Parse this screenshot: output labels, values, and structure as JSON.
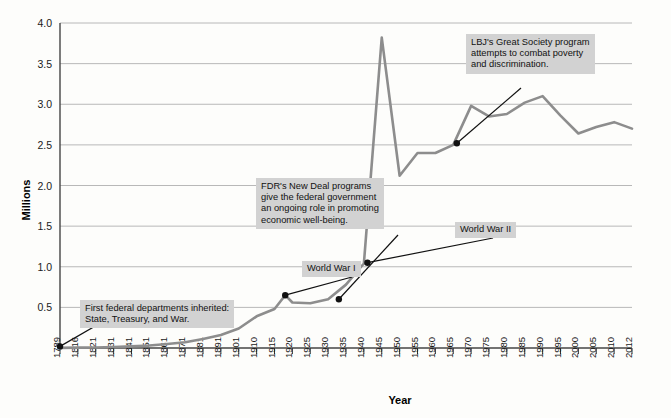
{
  "chart_data": {
    "type": "line",
    "title": "",
    "xlabel": "Year",
    "ylabel": "Millions",
    "ylim": [
      0,
      4.0
    ],
    "y_ticks": [
      "0.5",
      "1.0",
      "1.5",
      "2.0",
      "2.5",
      "3.0",
      "3.5",
      "4.0"
    ],
    "y_tick_values": [
      0.5,
      1.0,
      1.5,
      2.0,
      2.5,
      3.0,
      3.5,
      4.0
    ],
    "grid": true,
    "legend": "none",
    "x_tick_labels": [
      "1789",
      "1816",
      "1821",
      "1831",
      "1841",
      "1851",
      "1861",
      "1871",
      "1881",
      "1891",
      "1901",
      "1910",
      "1915",
      "1920",
      "1925",
      "1930",
      "1935",
      "1940",
      "1945",
      "1950",
      "1955",
      "1960",
      "1965",
      "1970",
      "1975",
      "1980",
      "1985",
      "1990",
      "1995",
      "2000",
      "2005",
      "2010",
      "2012"
    ],
    "series": [
      {
        "name": "Federal civilian employment",
        "x": [
          1789,
          1816,
          1821,
          1831,
          1841,
          1851,
          1861,
          1871,
          1881,
          1891,
          1901,
          1910,
          1915,
          1918,
          1920,
          1925,
          1930,
          1935,
          1940,
          1945,
          1950,
          1955,
          1960,
          1965,
          1970,
          1975,
          1980,
          1985,
          1990,
          1995,
          2000,
          2005,
          2010,
          2012
        ],
        "values": [
          0.001,
          0.005,
          0.007,
          0.012,
          0.02,
          0.03,
          0.05,
          0.07,
          0.11,
          0.16,
          0.24,
          0.39,
          0.48,
          0.65,
          0.56,
          0.55,
          0.6,
          0.78,
          1.04,
          3.82,
          2.12,
          2.4,
          2.4,
          2.5,
          2.98,
          2.85,
          2.88,
          3.02,
          3.1,
          2.86,
          2.64,
          2.72,
          2.78,
          2.7
        ]
      }
    ],
    "markers": [
      {
        "label": "first-departments-marker",
        "x": 1789,
        "y": 0.02
      },
      {
        "label": "world-war-1-marker",
        "x": 1918,
        "y": 0.65
      },
      {
        "label": "new-deal-marker",
        "x": 1933,
        "y": 0.6
      },
      {
        "label": "world-war-2-marker",
        "x": 1941,
        "y": 1.05
      },
      {
        "label": "great-society-marker",
        "x": 1966,
        "y": 2.52
      }
    ],
    "annotations": [
      {
        "name": "first-federal-departments-annotation",
        "text": "First federal departments inherited:\nState, Treasury, and War."
      },
      {
        "name": "world-war-1-annotation",
        "text": "World War I"
      },
      {
        "name": "fdr-new-deal-annotation",
        "text": "FDR's New Deal programs\ngive the federal government\nan ongoing role in promoting\neconomic well-being."
      },
      {
        "name": "world-war-2-annotation",
        "text": "World War II"
      },
      {
        "name": "lbj-great-society-annotation",
        "text": "LBJ's Great Society program\nattempts to combat poverty\nand discrimination."
      }
    ],
    "colors": {
      "line": "#8d8d8d",
      "grid": "#b8b8b8",
      "axis": "#444444",
      "annotation_background": "#d2d2d2",
      "text": "#111111",
      "marker": "#111111",
      "background": "#fdfdfb"
    }
  }
}
